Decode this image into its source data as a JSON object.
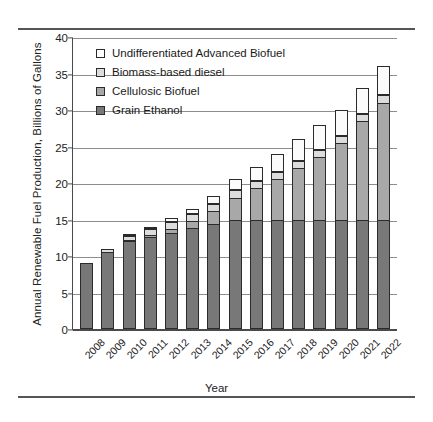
{
  "chart_data": {
    "type": "bar",
    "title": "",
    "xlabel": "Year",
    "ylabel": "Annual Renewable Fuel Production, Billions of Gallons",
    "ylim": [
      0,
      40
    ],
    "yticks": [
      0,
      5,
      10,
      15,
      20,
      25,
      30,
      35,
      40
    ],
    "grid": true,
    "stacked": true,
    "legend_position": "upper-left-inside",
    "categories": [
      "2008",
      "2009",
      "2010",
      "2011",
      "2012",
      "2013",
      "2014",
      "2015",
      "2016",
      "2017",
      "2018",
      "2019",
      "2020",
      "2021",
      "2022"
    ],
    "series": [
      {
        "name": "Grain Ethanol",
        "color": "#787878",
        "values": [
          9.0,
          10.5,
          12.0,
          12.6,
          13.2,
          13.8,
          14.4,
          15.0,
          15.0,
          15.0,
          15.0,
          15.0,
          15.0,
          15.0,
          15.0
        ]
      },
      {
        "name": "Cellulosic Biofuel",
        "color": "#a8a8a8",
        "values": [
          0.0,
          0.0,
          0.1,
          0.25,
          0.5,
          1.0,
          1.75,
          3.0,
          4.25,
          5.5,
          7.0,
          8.5,
          10.5,
          13.5,
          16.0
        ]
      },
      {
        "name": "Biomass-based diesel",
        "color": "#dcdcdc",
        "values": [
          0.0,
          0.5,
          0.65,
          0.8,
          1.0,
          1.0,
          1.0,
          1.0,
          1.0,
          1.0,
          1.0,
          1.0,
          1.0,
          1.0,
          1.0
        ]
      },
      {
        "name": "Undifferentiated Advanced Biofuel",
        "color": "#ffffff",
        "values": [
          0.0,
          0.0,
          0.15,
          0.35,
          0.5,
          0.7,
          1.05,
          1.5,
          2.0,
          2.5,
          3.0,
          3.5,
          3.5,
          3.5,
          4.0
        ]
      }
    ],
    "totals": [
      9.0,
      11.0,
      12.9,
      14.0,
      15.2,
      16.5,
      18.15,
      20.5,
      22.25,
      24.0,
      26.0,
      28.0,
      30.0,
      33.0,
      36.0
    ]
  },
  "legend": {
    "items": [
      {
        "label": "Undifferentiated Advanced Biofuel",
        "swatch": "sw-und"
      },
      {
        "label": "Biomass-based diesel",
        "swatch": "sw-bbd"
      },
      {
        "label": "Cellulosic Biofuel",
        "swatch": "sw-cell"
      },
      {
        "label": "Grain Ethanol",
        "swatch": "sw-grain"
      }
    ]
  },
  "axes": {
    "y_title": "Annual Renewable Fuel Production, Billions of Gallons",
    "x_title": "Year"
  }
}
